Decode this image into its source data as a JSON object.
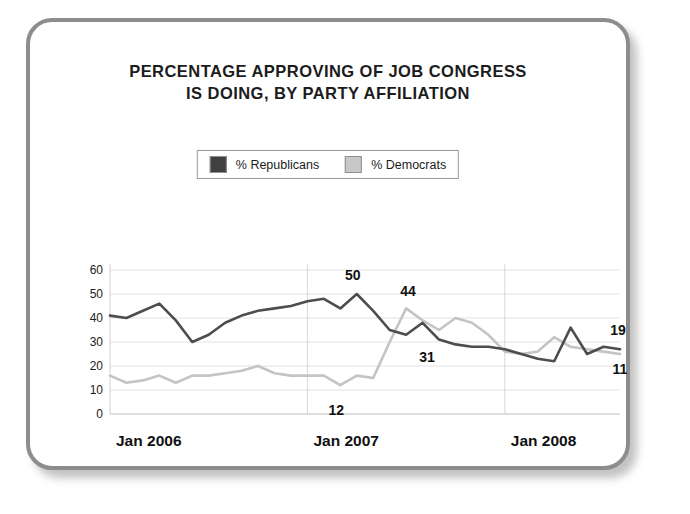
{
  "card": {
    "border_color": "#8d8d8d",
    "background": "#ffffff"
  },
  "title": {
    "line1": "PERCENTAGE APPROVING OF JOB CONGRESS",
    "line2": "IS DOING, BY PARTY AFFILIATION"
  },
  "legend": {
    "position": "top-center",
    "entries": [
      {
        "label": "% Republicans",
        "color": "#404040"
      },
      {
        "label": "% Democrats",
        "color": "#c8c8c8"
      }
    ]
  },
  "axes": {
    "y_ticks": [
      "60",
      "50",
      "40",
      "30",
      "20",
      "10",
      "0"
    ],
    "x_ticks": [
      "Jan 2006",
      "Jan 2007",
      "Jan 2008"
    ]
  },
  "annotations": [
    {
      "text": "50",
      "series": "% Republicans",
      "value": 50
    },
    {
      "text": "44",
      "series": "% Democrats",
      "value": 44
    },
    {
      "text": "31",
      "series": "% Republicans",
      "value": 31
    },
    {
      "text": "12",
      "series": "% Democrats",
      "value": 12
    },
    {
      "text": "19",
      "series": "% Republicans",
      "value": 19
    },
    {
      "text": "11",
      "series": "% Democrats",
      "value": 11
    }
  ],
  "chart_data": {
    "type": "line",
    "title": "PERCENTAGE APPROVING OF JOB CONGRESS IS DOING, BY PARTY AFFILIATION",
    "xlabel": "",
    "ylabel": "",
    "ylim": [
      0,
      60
    ],
    "ytick_step": 10,
    "grid": "horizontal-and-vertical",
    "legend_position": "top-center",
    "x": [
      "Jan 2006",
      "Feb 2006",
      "Mar 2006",
      "Apr 2006",
      "May 2006",
      "Jun 2006",
      "Jul 2006",
      "Aug 2006",
      "Sep 2006",
      "Oct 2006",
      "Nov 2006",
      "Dec 2006",
      "Jan 2007",
      "Feb 2007",
      "Mar 2007",
      "Apr 2007",
      "May 2007",
      "Jun 2007",
      "Jul 2007",
      "Aug 2007",
      "Sep 2007",
      "Oct 2007",
      "Nov 2007",
      "Dec 2007",
      "Jan 2008",
      "Feb 2008",
      "Mar 2008",
      "Apr 2008",
      "May 2008",
      "Jun 2008",
      "Jul 2008",
      "Aug 2008"
    ],
    "series": [
      {
        "name": "% Republicans",
        "color": "#4d4d4d",
        "values": [
          41,
          40,
          43,
          46,
          39,
          30,
          33,
          38,
          41,
          43,
          44,
          45,
          47,
          48,
          44,
          50,
          43,
          35,
          33,
          38,
          31,
          29,
          28,
          28,
          27,
          25,
          23,
          22,
          36,
          25,
          28,
          27
        ],
        "labeled_points": [
          {
            "x": "Apr 2007",
            "value": 50,
            "label": "50"
          },
          {
            "x": "Sep 2007",
            "value": 31,
            "label": "31"
          },
          {
            "x": "Aug 2008",
            "value": 19,
            "label": "19"
          }
        ]
      },
      {
        "name": "% Democrats",
        "color": "#c4c4c4",
        "values": [
          16,
          13,
          14,
          16,
          13,
          16,
          16,
          17,
          18,
          20,
          17,
          16,
          16,
          16,
          12,
          16,
          15,
          30,
          44,
          39,
          35,
          40,
          38,
          33,
          26,
          25,
          26,
          32,
          28,
          27,
          26,
          25
        ],
        "labeled_points": [
          {
            "x": "Mar 2007",
            "value": 12,
            "label": "12"
          },
          {
            "x": "Jul 2007",
            "value": 44,
            "label": "44"
          },
          {
            "x": "Aug 2008",
            "value": 11,
            "label": "11"
          }
        ]
      }
    ]
  }
}
